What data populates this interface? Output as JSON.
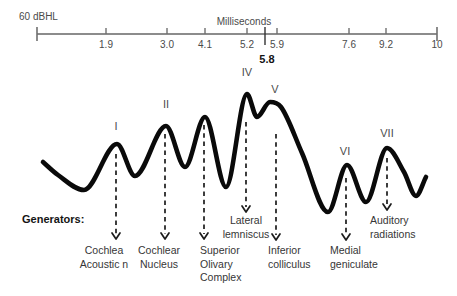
{
  "figure": {
    "stimulus_label": "60 dBHL",
    "generators_heading": "Generators:",
    "axis": {
      "title": "Milliseconds",
      "y": 34,
      "x_start": 37,
      "x_end": 437,
      "line_color": "#8c8c8c",
      "tick_color": "#6f6f6f",
      "ticks": [
        {
          "label": "1.9",
          "x": 106
        },
        {
          "label": "3.0",
          "x": 167
        },
        {
          "label": "4.1",
          "x": 205
        },
        {
          "label": "5.2",
          "x": 247
        },
        {
          "label": "5.9",
          "x": 277
        },
        {
          "label": "7.6",
          "x": 349
        },
        {
          "label": "9.2",
          "x": 386
        },
        {
          "label": "10",
          "x": 437
        }
      ],
      "marker": {
        "label": "5.8",
        "x": 265,
        "y1": 27,
        "y2": 45,
        "label_y": 53,
        "color": "#333333"
      }
    },
    "waves": [
      {
        "numeral": "I",
        "x": 116,
        "y": 126
      },
      {
        "numeral": "II",
        "x": 166,
        "y": 104
      },
      {
        "numeral": "IV",
        "x": 247,
        "y": 72
      },
      {
        "numeral": "V",
        "x": 275,
        "y": 89
      },
      {
        "numeral": "VI",
        "x": 345,
        "y": 151
      },
      {
        "numeral": "VII",
        "x": 387,
        "y": 133
      }
    ],
    "generators": [
      {
        "name": [
          "Cochlea",
          "Acoustic n"
        ],
        "arrow_x": 116,
        "arrow_y1": 154,
        "arrow_y2": 239,
        "label_x": 104,
        "label_y": 244,
        "align": "center"
      },
      {
        "name": [
          "Cochlear",
          "Nucleus"
        ],
        "arrow_x": 165,
        "arrow_y1": 134,
        "arrow_y2": 239,
        "label_x": 159,
        "label_y": 244,
        "align": "center"
      },
      {
        "name": [
          "Superior",
          "Olivary",
          "Complex"
        ],
        "arrow_x": 204,
        "arrow_y1": 125,
        "arrow_y2": 239,
        "label_x": 200,
        "label_y": 244,
        "align": "left"
      },
      {
        "name": [
          "Lateral",
          "lemniscus"
        ],
        "arrow_x": 246,
        "arrow_y1": 122,
        "arrow_y2": 212,
        "label_x": 246,
        "label_y": 214,
        "align": "center"
      },
      {
        "name": [
          "Inferior",
          "colliculus"
        ],
        "arrow_x": 276,
        "arrow_y1": 134,
        "arrow_y2": 240,
        "label_x": 268,
        "label_y": 244,
        "align": "left"
      },
      {
        "name": [
          "Medial",
          "geniculate"
        ],
        "arrow_x": 346,
        "arrow_y1": 178,
        "arrow_y2": 240,
        "label_x": 330,
        "label_y": 244,
        "align": "left"
      },
      {
        "name": [
          "Auditory",
          "radiations"
        ],
        "arrow_x": 387,
        "arrow_y1": 158,
        "arrow_y2": 210,
        "label_x": 370,
        "label_y": 214,
        "align": "left"
      }
    ],
    "arrow_color": "#1c1c1c",
    "waveform": {
      "color": "#0a0a0a",
      "stroke_width": 4.6,
      "points": [
        [
          43,
          162
        ],
        [
          58,
          175
        ],
        [
          84,
          190
        ],
        [
          117,
          144
        ],
        [
          135,
          176
        ],
        [
          166,
          126
        ],
        [
          185,
          167
        ],
        [
          205,
          117
        ],
        [
          226,
          187
        ],
        [
          247,
          94
        ],
        [
          257,
          117
        ],
        [
          270,
          102
        ],
        [
          281,
          107
        ],
        [
          302,
          153
        ],
        [
          328,
          212
        ],
        [
          347,
          165
        ],
        [
          366,
          202
        ],
        [
          387,
          148
        ],
        [
          404,
          172
        ],
        [
          416,
          196
        ],
        [
          426,
          177
        ]
      ]
    }
  }
}
